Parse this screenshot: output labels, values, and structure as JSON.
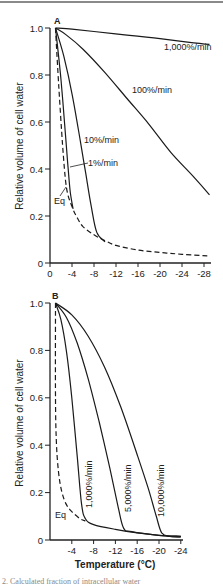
{
  "caption_partial": "2. Calculated fraction of intracellular water",
  "chart_data": [
    {
      "panel": "A",
      "type": "line",
      "title": "",
      "xlabel": "",
      "ylabel": "Relative volume of cell water",
      "xlim": [
        0,
        -29
      ],
      "ylim": [
        0,
        1.0
      ],
      "x_ticks": [
        "0",
        "-4",
        "-8",
        "-12",
        "-16",
        "-20",
        "-24",
        "-28"
      ],
      "y_ticks": [
        "0",
        "0.2",
        "0.4",
        "0.6",
        "0.8",
        "1.0"
      ],
      "grid": false,
      "series": [
        {
          "name": "1,000%/min",
          "style": "solid",
          "x": [
            -1,
            -4,
            -8,
            -14,
            -20,
            -25,
            -29
          ],
          "y": [
            1.0,
            0.995,
            0.985,
            0.97,
            0.955,
            0.94,
            0.93
          ]
        },
        {
          "name": "100%/min",
          "style": "solid",
          "x": [
            -1,
            -3,
            -6,
            -10,
            -14,
            -18,
            -22,
            -26,
            -29
          ],
          "y": [
            1.0,
            0.97,
            0.91,
            0.81,
            0.7,
            0.59,
            0.47,
            0.37,
            0.29
          ]
        },
        {
          "name": "10%/min",
          "style": "solid",
          "x": [
            -1,
            -2.5,
            -4,
            -5.5,
            -6.5,
            -7.5,
            -8.5,
            -10
          ],
          "y": [
            1.0,
            0.88,
            0.72,
            0.52,
            0.38,
            0.24,
            0.13,
            0.09
          ]
        },
        {
          "name": "1%/min",
          "style": "solid",
          "x": [
            -1,
            -2,
            -2.8,
            -3.3,
            -3.7,
            -4.2
          ],
          "y": [
            1.0,
            0.78,
            0.55,
            0.4,
            0.3,
            0.23
          ]
        },
        {
          "name": "Eq",
          "style": "dashed",
          "x": [
            -1,
            -1.6,
            -2.3,
            -3,
            -4,
            -5,
            -6,
            -8,
            -10,
            -12,
            -16,
            -20,
            -24,
            -29
          ],
          "y": [
            1.0,
            0.75,
            0.5,
            0.32,
            0.24,
            0.19,
            0.155,
            0.12,
            0.095,
            0.075,
            0.055,
            0.045,
            0.037,
            0.03
          ]
        }
      ],
      "annotations": [
        "A",
        "1,000%/min",
        "100%/min",
        "10%/min",
        "1%/min",
        "Eq"
      ]
    },
    {
      "panel": "B",
      "type": "line",
      "title": "",
      "xlabel": "Temperature (°C)",
      "ylabel": "Relative volume of cell water",
      "xlim": [
        0,
        -24
      ],
      "ylim": [
        0,
        1.0
      ],
      "x_ticks": [
        "-4",
        "-8",
        "-12",
        "-16",
        "-20",
        "-24"
      ],
      "y_ticks": [
        "0",
        "0.2",
        "0.4",
        "0.6",
        "0.8",
        "1.0"
      ],
      "grid": false,
      "series": [
        {
          "name": "Eq",
          "style": "dashed",
          "x": [
            -1,
            -1,
            -1.2,
            -1.6,
            -2.2,
            -3,
            -4,
            -5.5,
            -6.5
          ],
          "y": [
            1.0,
            0.6,
            0.4,
            0.28,
            0.2,
            0.15,
            0.12,
            0.09,
            0.08
          ]
        },
        {
          "name": "1,000%/min",
          "style": "solid",
          "x": [
            -1,
            -2,
            -3,
            -4,
            -5,
            -5.8,
            -6.5,
            -8,
            -12,
            -16,
            -20,
            -24
          ],
          "y": [
            1.0,
            0.93,
            0.8,
            0.6,
            0.35,
            0.15,
            0.09,
            0.065,
            0.045,
            0.03,
            0.02,
            0.015
          ]
        },
        {
          "name": "5,000%/min",
          "style": "solid",
          "x": [
            -1,
            -3,
            -5,
            -7,
            -9,
            -11,
            -12.5,
            -13.5,
            -15,
            -20,
            -24
          ],
          "y": [
            1.0,
            0.94,
            0.83,
            0.68,
            0.5,
            0.3,
            0.14,
            0.05,
            0.035,
            0.02,
            0.015
          ]
        },
        {
          "name": "10,000%/min",
          "style": "solid",
          "x": [
            -1,
            -4,
            -7,
            -10,
            -13,
            -16,
            -18,
            -19.5,
            -20.5,
            -22,
            -24
          ],
          "y": [
            1.0,
            0.95,
            0.86,
            0.73,
            0.56,
            0.36,
            0.22,
            0.1,
            0.03,
            0.015,
            0.012
          ]
        }
      ],
      "annotations": [
        "B",
        "1,000%/min",
        "5,000%/min",
        "10,000%/min",
        "Eq"
      ]
    }
  ],
  "panelA": {
    "letter": "A",
    "ylabel": "Relative volume of cell water",
    "yticks": [
      {
        "v": 1.0,
        "t": "1.0"
      },
      {
        "v": 0.8,
        "t": "0.8"
      },
      {
        "v": 0.6,
        "t": "0.6"
      },
      {
        "v": 0.4,
        "t": "0.4"
      },
      {
        "v": 0.2,
        "t": "0.2"
      },
      {
        "v": 0,
        "t": "0"
      }
    ],
    "xticks": [
      {
        "v": 0,
        "t": "0"
      },
      {
        "v": -4,
        "t": "-4"
      },
      {
        "v": -8,
        "t": "-8"
      },
      {
        "v": -12,
        "t": "-12"
      },
      {
        "v": -16,
        "t": "-16"
      },
      {
        "v": -20,
        "t": "-20"
      },
      {
        "v": -24,
        "t": "-24"
      },
      {
        "v": -28,
        "t": "-28"
      }
    ],
    "labels": {
      "r1000": "1,000%/min",
      "r100": "100%/min",
      "r10": "10%/min",
      "r1": "1%/min",
      "eq": "Eq"
    }
  },
  "panelB": {
    "letter": "B",
    "ylabel": "Relative volume of cell water",
    "xtitle": "Temperature (°C)",
    "yticks": [
      {
        "v": 1.0,
        "t": "1.0"
      },
      {
        "v": 0.8,
        "t": "0.8"
      },
      {
        "v": 0.6,
        "t": "0.6"
      },
      {
        "v": 0.4,
        "t": "0.4"
      },
      {
        "v": 0.2,
        "t": "0.2"
      },
      {
        "v": 0,
        "t": "0"
      }
    ],
    "xticks": [
      {
        "v": -4,
        "t": "-4"
      },
      {
        "v": -8,
        "t": "-8"
      },
      {
        "v": -12,
        "t": "-12"
      },
      {
        "v": -16,
        "t": "-16"
      },
      {
        "v": -20,
        "t": "-20"
      },
      {
        "v": -24,
        "t": "-24"
      }
    ],
    "labels": {
      "r1000": "1,000%/min",
      "r5000": "5,000%/min",
      "r10000": "10,000%/min",
      "eq": "Eq"
    }
  }
}
